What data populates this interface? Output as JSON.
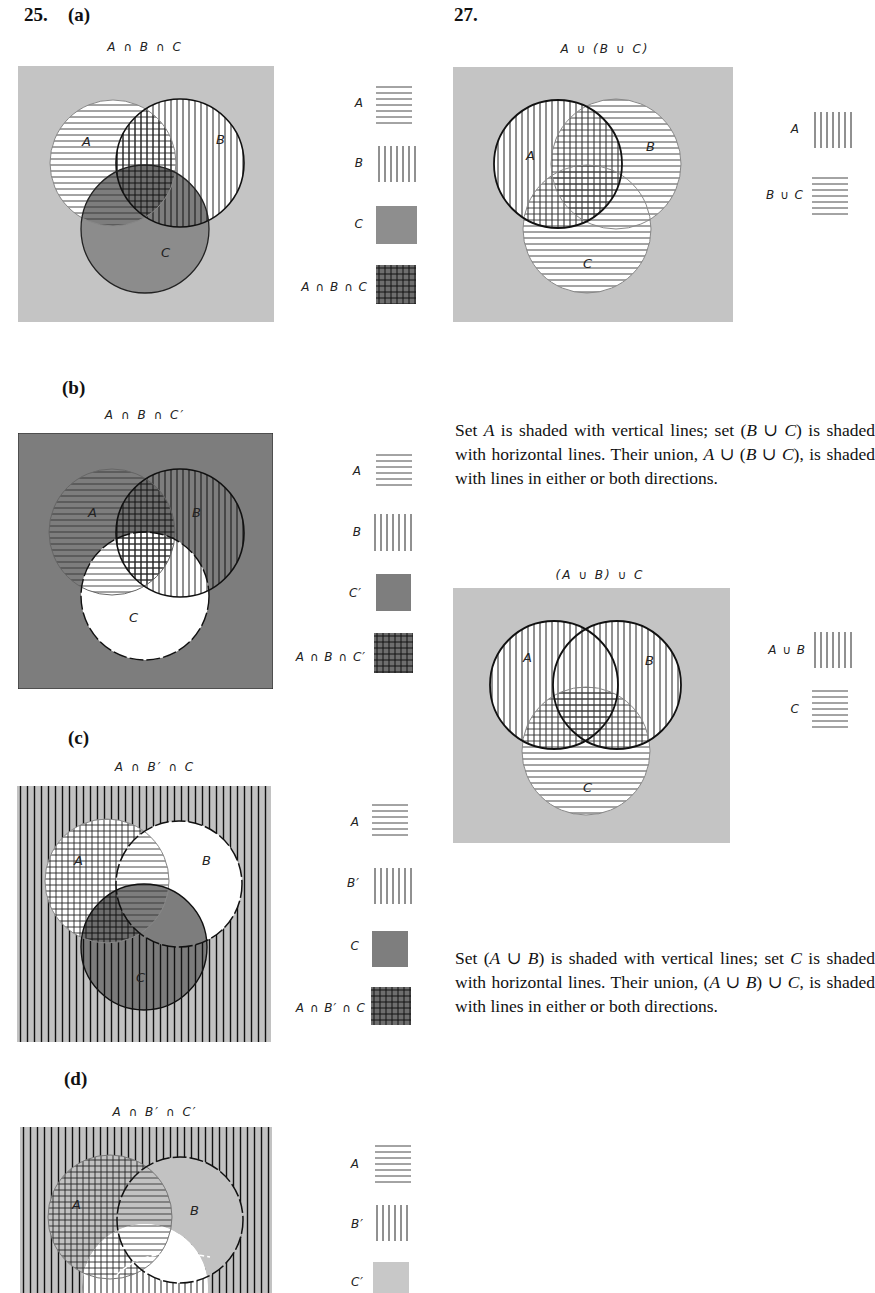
{
  "problem25": {
    "number": "25.",
    "parts": [
      {
        "label": "(a)",
        "title": "A ∩ B ∩ C",
        "region_labels": [
          "A",
          "B",
          "C"
        ],
        "legend": [
          {
            "label": "A",
            "swatch": "horizontal-lines"
          },
          {
            "label": "B",
            "swatch": "vertical-lines"
          },
          {
            "label": "C",
            "swatch": "gray-fill"
          },
          {
            "label": "A ∩ B ∩ C",
            "swatch": "dark-crosshatch"
          }
        ]
      },
      {
        "label": "(b)",
        "title": "A ∩ B ∩ C′",
        "region_labels": [
          "A",
          "B",
          "C"
        ],
        "legend": [
          {
            "label": "A",
            "swatch": "horizontal-lines"
          },
          {
            "label": "B",
            "swatch": "vertical-lines"
          },
          {
            "label": "C′",
            "swatch": "gray-fill"
          },
          {
            "label": "A ∩ B ∩ C′",
            "swatch": "dark-crosshatch"
          }
        ]
      },
      {
        "label": "(c)",
        "title": "A ∩ B′ ∩ C",
        "region_labels": [
          "A",
          "B",
          "C"
        ],
        "legend": [
          {
            "label": "A",
            "swatch": "horizontal-lines"
          },
          {
            "label": "B′",
            "swatch": "vertical-lines"
          },
          {
            "label": "C",
            "swatch": "gray-fill"
          },
          {
            "label": "A ∩ B′ ∩ C",
            "swatch": "dark-crosshatch"
          }
        ]
      },
      {
        "label": "(d)",
        "title": "A ∩ B′ ∩ C′",
        "region_labels": [
          "A",
          "B",
          "C"
        ],
        "legend": [
          {
            "label": "A",
            "swatch": "horizontal-lines"
          },
          {
            "label": "B′",
            "swatch": "vertical-lines"
          },
          {
            "label": "C′",
            "swatch": "light-gray-fill"
          }
        ]
      }
    ]
  },
  "problem27": {
    "number": "27.",
    "diagrams": [
      {
        "title": "A ∪ (B ∪ C)",
        "region_labels": [
          "A",
          "B",
          "C"
        ],
        "legend": [
          {
            "label": "A",
            "swatch": "vertical-lines"
          },
          {
            "label": "B ∪ C",
            "swatch": "horizontal-lines"
          }
        ],
        "caption": {
          "s1": "Set ",
          "v1": "A",
          "s2": " is shaded with vertical lines; set (",
          "v2": "B",
          "s3": " ∪ ",
          "v3": "C",
          "s4": ") is shaded with horizontal lines. Their union, ",
          "v4": "A",
          "s5": " ∪ (",
          "v5": "B",
          "s6": " ∪ ",
          "v6": "C",
          "s7": "), is shaded with lines in either or both directions."
        }
      },
      {
        "title": "(A ∪ B) ∪ C",
        "region_labels": [
          "A",
          "B",
          "C"
        ],
        "legend": [
          {
            "label": "A ∪ B",
            "swatch": "vertical-lines"
          },
          {
            "label": "C",
            "swatch": "horizontal-lines"
          }
        ],
        "caption": {
          "s1": "Set (",
          "v1": "A",
          "s2": " ∪ ",
          "v2": "B",
          "s3": ") is shaded with vertical lines; set ",
          "v3": "C",
          "s4": " is shaded with horizontal lines. Their union, (",
          "v4": "A",
          "s5": " ∪ ",
          "v5": "B",
          "s6": ") ∪ ",
          "v6": "C",
          "s7": ", is shaded with lines in either or both directions."
        }
      }
    ]
  },
  "colors": {
    "universe_gray": "#c4c4c4",
    "dark_gray": "#8a8a8a",
    "darker_gray": "#6e6e6e",
    "line": "#222222"
  }
}
